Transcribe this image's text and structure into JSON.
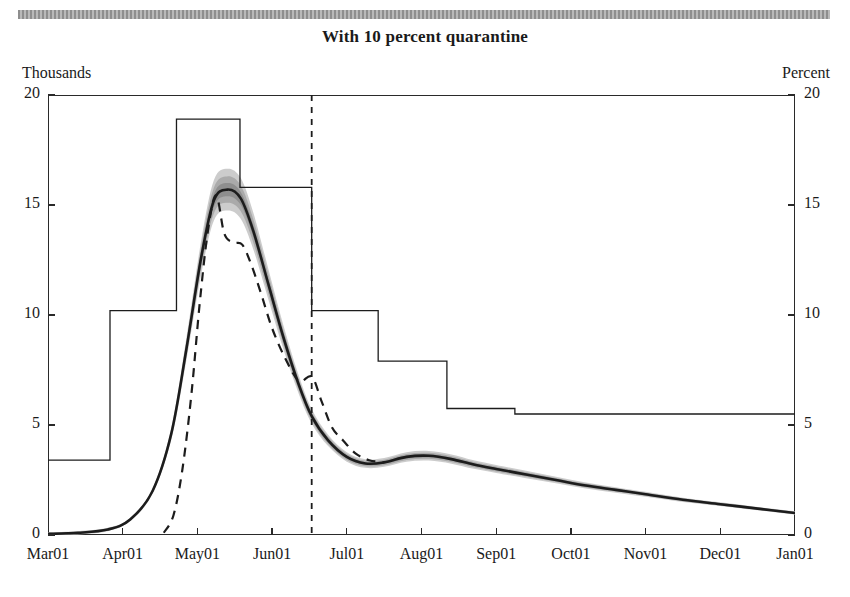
{
  "figure": {
    "title": "With 10 percent quarantine",
    "left_axis_unit": "Thousands",
    "right_axis_unit": "Percent"
  },
  "chart_data": {
    "type": "line",
    "title": "With 10 percent quarantine",
    "xlabel": "",
    "ylabel": "Thousands",
    "ylabel_right": "Percent",
    "xlim": [
      "Mar01",
      "Jan01"
    ],
    "ylim": [
      0,
      20
    ],
    "ylim_right": [
      0,
      20
    ],
    "grid": false,
    "legend": "none",
    "x_tick_labels": [
      "Mar01",
      "Apr01",
      "May01",
      "Jun01",
      "Jul01",
      "Aug01",
      "Sep01",
      "Oct01",
      "Nov01",
      "Dec01",
      "Jan01"
    ],
    "y_tick_labels_left": [
      "0",
      "5",
      "10",
      "15",
      "20"
    ],
    "y_tick_labels_right": [
      "0",
      "5",
      "10",
      "15",
      "20"
    ],
    "y_tick_values": [
      0,
      5,
      10,
      15,
      20
    ],
    "vertical_marker": {
      "x": "Jun01",
      "x_frac": 0.353,
      "style": "dashed"
    },
    "series": [
      {
        "name": "step-path-percent",
        "style": "solid-thin-step",
        "axis": "right",
        "steps": [
          {
            "x_start": 0.0,
            "x_end": 0.083,
            "value": 3.4
          },
          {
            "x_start": 0.083,
            "x_end": 0.172,
            "value": 10.2
          },
          {
            "x_start": 0.172,
            "x_end": 0.257,
            "value": 18.9
          },
          {
            "x_start": 0.257,
            "x_end": 0.353,
            "value": 15.8
          },
          {
            "x_start": 0.353,
            "x_end": 0.442,
            "value": 10.2
          },
          {
            "x_start": 0.442,
            "x_end": 0.534,
            "value": 7.9
          },
          {
            "x_start": 0.534,
            "x_end": 0.625,
            "value": 5.75
          },
          {
            "x_start": 0.625,
            "x_end": 1.0,
            "value": 5.5
          }
        ]
      },
      {
        "name": "median-forecast",
        "style": "solid-thick",
        "axis": "left",
        "x_frac": [
          0.0,
          0.04,
          0.08,
          0.11,
          0.14,
          0.165,
          0.185,
          0.205,
          0.222,
          0.24,
          0.258,
          0.275,
          0.295,
          0.315,
          0.335,
          0.353,
          0.375,
          0.4,
          0.425,
          0.45,
          0.48,
          0.51,
          0.54,
          0.57,
          0.6,
          0.64,
          0.68,
          0.72,
          0.76,
          0.8,
          0.85,
          0.9,
          0.95,
          1.0
        ],
        "values": [
          0.05,
          0.1,
          0.25,
          0.7,
          2.0,
          4.6,
          8.4,
          12.6,
          15.2,
          15.7,
          15.3,
          13.8,
          11.4,
          9.0,
          6.9,
          5.4,
          4.3,
          3.55,
          3.25,
          3.3,
          3.55,
          3.6,
          3.45,
          3.2,
          3.0,
          2.75,
          2.5,
          2.25,
          2.05,
          1.85,
          1.6,
          1.4,
          1.2,
          1.0
        ]
      },
      {
        "name": "uncertainty-fan",
        "style": "shaded-bands",
        "axis": "left",
        "bands": [
          {
            "name": "outer",
            "half_width_peak": 0.95,
            "color": "#c9c9c9"
          },
          {
            "name": "mid",
            "half_width_peak": 0.6,
            "color": "#a8a8a8"
          },
          {
            "name": "inner",
            "half_width_peak": 0.3,
            "color": "#8c8c8c"
          }
        ]
      },
      {
        "name": "alternative-scenario",
        "style": "dashed",
        "axis": "left",
        "x_frac": [
          0.155,
          0.168,
          0.18,
          0.192,
          0.203,
          0.214,
          0.225,
          0.236,
          0.248,
          0.26,
          0.272,
          0.285,
          0.3,
          0.318,
          0.336,
          0.353,
          0.366,
          0.38,
          0.395,
          0.412,
          0.43,
          0.45
        ],
        "values": [
          0.1,
          0.9,
          3.0,
          6.4,
          10.5,
          13.8,
          15.45,
          13.7,
          13.3,
          13.2,
          12.3,
          11.0,
          9.4,
          8.0,
          7.0,
          7.2,
          6.1,
          4.9,
          4.3,
          3.7,
          3.4,
          3.3
        ]
      }
    ]
  },
  "colors": {
    "line": "#1c1c1c",
    "frame": "#2a2a2a",
    "band_outer": "#c9c9c9",
    "band_mid": "#a8a8a8",
    "band_inner": "#8c8c8c",
    "rule": "#9a9a9a"
  }
}
